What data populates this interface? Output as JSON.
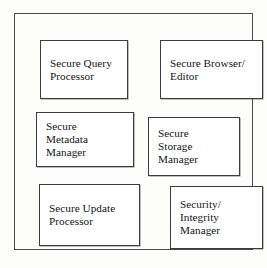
{
  "diagram": {
    "frame": {
      "name": "outer-system-boundary"
    },
    "colors": {
      "background": "#fdfdfc",
      "box_fill": "#ffffff",
      "box_border": "#3b3b3b",
      "frame_border": "#4a4a4a",
      "text": "#151515"
    },
    "components": [
      {
        "id": "secure-query-processor",
        "label": "Secure Query\nProcessor"
      },
      {
        "id": "secure-browser-editor",
        "label": "Secure Browser/\nEditor"
      },
      {
        "id": "secure-metadata-manager",
        "label": "Secure\nMetadata\nManager"
      },
      {
        "id": "secure-storage-manager",
        "label": "Secure\nStorage\nManager"
      },
      {
        "id": "secure-update-processor",
        "label": "Secure Update\nProcessor"
      },
      {
        "id": "security-integrity-manager",
        "label": "Security/\nIntegrity\nManager"
      }
    ]
  }
}
